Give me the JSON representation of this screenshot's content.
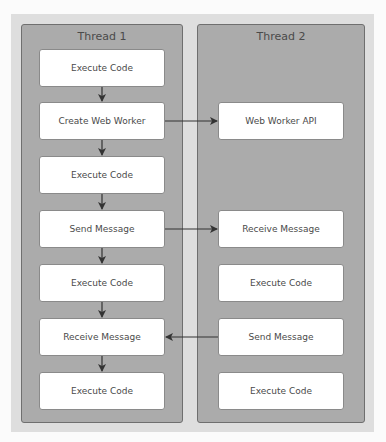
{
  "diagram": {
    "threads": [
      {
        "title": "Thread 1",
        "steps": [
          "Execute Code",
          "Create Web Worker",
          "Execute Code",
          "Send Message",
          "Execute Code",
          "Receive Message",
          "Execute Code"
        ]
      },
      {
        "title": "Thread 2",
        "steps": [
          "Web Worker API",
          "Receive Message",
          "Execute Code",
          "Send Message",
          "Execute Code"
        ]
      }
    ],
    "connections": [
      {
        "from": "Thread 1: Create Web Worker",
        "to": "Thread 2: Web Worker API"
      },
      {
        "from": "Thread 1: Send Message",
        "to": "Thread 2: Receive Message"
      },
      {
        "from": "Thread 2: Send Message",
        "to": "Thread 1: Receive Message"
      }
    ],
    "colors": {
      "outer_panel": "#dedede",
      "thread_fill": "#ababab",
      "thread_border": "#6f6f6f",
      "box_fill": "#ffffff",
      "text": "#4a4a4a",
      "arrow": "#333333"
    }
  }
}
